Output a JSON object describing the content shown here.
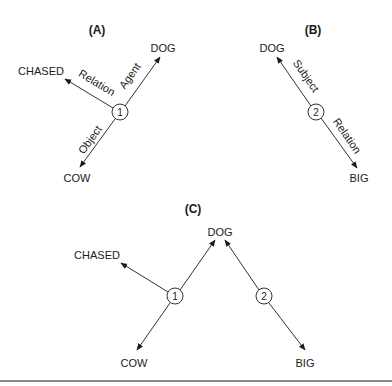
{
  "panels": {
    "a": {
      "label": "(A)",
      "proposition": "1",
      "nodes": {
        "relation": "CHASED",
        "agent": "DOG",
        "object": "COW"
      },
      "edges": {
        "relation": "Relation",
        "agent": "Agent",
        "object": "Object"
      }
    },
    "b": {
      "label": "(B)",
      "proposition": "2",
      "nodes": {
        "subject": "DOG",
        "relation": "BIG"
      },
      "edges": {
        "subject": "Subject",
        "relation": "Relation"
      }
    },
    "c": {
      "label": "(C)",
      "propositions": [
        "1",
        "2"
      ],
      "nodes": {
        "chased": "CHASED",
        "dog": "DOG",
        "cow": "COW",
        "big": "BIG"
      }
    }
  },
  "colors": {
    "line": "#333333",
    "text": "#1a1a1a",
    "rule": "#8a8a8a",
    "background": "#ffffff"
  }
}
